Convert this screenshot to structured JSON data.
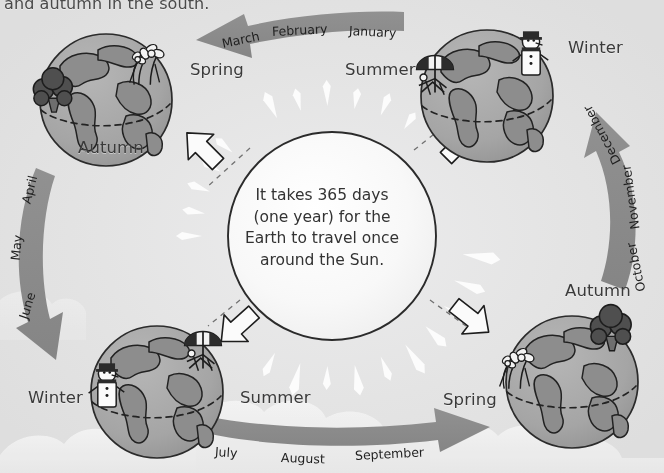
{
  "page": {
    "background_color": "#e3e3e3",
    "arrow_color": "#8a8a8a",
    "globe_color": "#a8a8a8",
    "land_color": "#8f8f8f",
    "sun_color": "#f7f7f7",
    "text_color": "#3a3a3a"
  },
  "top_caption": "and autumn in the south.",
  "center_text": {
    "line1": "It takes 365 days",
    "line2": "(one year) for the",
    "line3": "Earth to travel once",
    "line4": "around the Sun."
  },
  "sun": {
    "label": "sun",
    "days_per_year": 365
  },
  "arrows": [
    {
      "id": "top-arrow",
      "direction": "left",
      "months": [
        "March",
        "February",
        "January"
      ]
    },
    {
      "id": "left-arrow",
      "direction": "down",
      "months": [
        "April",
        "May",
        "June"
      ]
    },
    {
      "id": "bottom-arrow",
      "direction": "right",
      "months": [
        "July",
        "August",
        "September"
      ]
    },
    {
      "id": "right-arrow",
      "direction": "up",
      "months": [
        "October",
        "November",
        "December"
      ]
    }
  ],
  "globes": [
    {
      "id": "globe-top-left",
      "position": "top-left",
      "north_label": "Spring",
      "south_label": "Autumn",
      "north_feature": "flowers",
      "south_feature": "tree"
    },
    {
      "id": "globe-top-right",
      "position": "top-right",
      "north_label": "Winter",
      "south_label": "Summer",
      "north_feature": "snowman",
      "south_feature": "beach-umbrella"
    },
    {
      "id": "globe-bottom-right",
      "position": "bottom-right",
      "north_label": "Autumn",
      "south_label": "Spring",
      "north_feature": "tree",
      "south_feature": "flowers"
    },
    {
      "id": "globe-bottom-left",
      "position": "bottom-left",
      "north_label": "Winter",
      "south_label": "Summer",
      "north_feature": "snowman",
      "south_feature": "beach-umbrella"
    }
  ],
  "season_labels": [
    {
      "text": "Spring",
      "x": 190,
      "y": 60
    },
    {
      "text": "Autumn",
      "x": 78,
      "y": 138
    },
    {
      "text": "Summer",
      "x": 345,
      "y": 60
    },
    {
      "text": "Winter",
      "x": 568,
      "y": 38
    },
    {
      "text": "Autumn",
      "x": 565,
      "y": 281
    },
    {
      "text": "Spring",
      "x": 443,
      "y": 390
    },
    {
      "text": "Winter",
      "x": 28,
      "y": 388
    },
    {
      "text": "Summer",
      "x": 240,
      "y": 388
    }
  ],
  "month_labels": [
    {
      "text": "March",
      "x": 222,
      "y": 36,
      "rot": -12
    },
    {
      "text": "February",
      "x": 272,
      "y": 24,
      "rot": -3
    },
    {
      "text": "January",
      "x": 349,
      "y": 23,
      "rot": 3
    },
    {
      "text": "April",
      "x": 26,
      "y": 196,
      "rot": -76
    },
    {
      "text": "May",
      "x": 15,
      "y": 253,
      "rot": -84
    },
    {
      "text": "June",
      "x": 23,
      "y": 311,
      "rot": -72
    },
    {
      "text": "July",
      "x": 215,
      "y": 444,
      "rot": 4
    },
    {
      "text": "August",
      "x": 281,
      "y": 450,
      "rot": 2
    },
    {
      "text": "September",
      "x": 355,
      "y": 448,
      "rot": -3
    },
    {
      "text": "October",
      "x": 641,
      "y": 284,
      "rot": -102
    },
    {
      "text": "November",
      "x": 635,
      "y": 222,
      "rot": -98
    },
    {
      "text": "December",
      "x": 617,
      "y": 156,
      "rot": -118
    }
  ]
}
